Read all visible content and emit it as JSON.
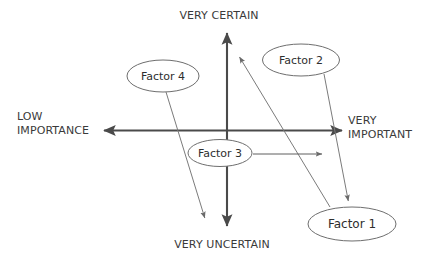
{
  "diagram": {
    "type": "scatter-quadrant-diagram",
    "background_color": "#ffffff",
    "axes": {
      "vertical": {
        "top_label": "VERY CERTAIN",
        "bottom_label": "VERY UNCERTAIN",
        "x": 227,
        "y_top": 29,
        "y_bottom": 230,
        "color": "#4a4a4a"
      },
      "horizontal": {
        "left_label_line1": "LOW",
        "left_label_line2": "IMPORTANCE",
        "right_label_line1": "VERY",
        "right_label_line2": "IMPORTANT",
        "y": 130,
        "x_left": 100,
        "x_right": 346,
        "color": "#4a4a4a"
      }
    },
    "nodes": [
      {
        "id": "factor-1",
        "label": "Factor 1",
        "cx": 352,
        "cy": 224,
        "rx": 44,
        "ry": 17
      },
      {
        "id": "factor-2",
        "label": "Factor 2",
        "cx": 301,
        "cy": 60,
        "rx": 38.5,
        "ry": 16
      },
      {
        "id": "factor-3",
        "label": "Factor 3",
        "cx": 220,
        "cy": 153,
        "rx": 32,
        "ry": 13.5
      },
      {
        "id": "factor-4",
        "label": "Factor 4",
        "cx": 163,
        "cy": 76,
        "rx": 36,
        "ry": 16
      }
    ],
    "arrows": [
      {
        "id": "arrow-factor-1-to-upper-left",
        "from": "factor-1",
        "x1": 330,
        "y1": 207,
        "x2": 237,
        "y2": 53
      },
      {
        "id": "arrow-factor-2-to-factor-1",
        "from": "factor-2",
        "x1": 324,
        "y1": 74,
        "x2": 349,
        "y2": 205
      },
      {
        "id": "arrow-factor-3-to-right",
        "from": "factor-3",
        "x1": 253,
        "y1": 154,
        "x2": 327,
        "y2": 154
      },
      {
        "id": "arrow-factor-4-to-lower-right",
        "from": "factor-4",
        "x1": 166,
        "y1": 92,
        "x2": 206,
        "y2": 222
      }
    ]
  }
}
